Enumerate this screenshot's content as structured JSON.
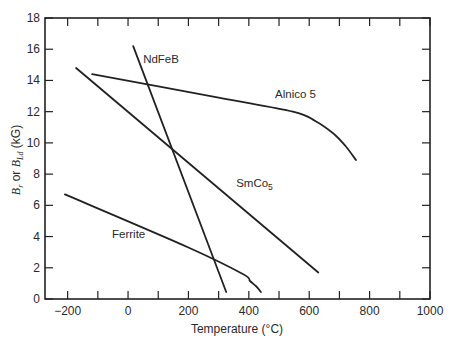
{
  "chart_data": {
    "type": "line",
    "title": "",
    "xlabel": "Temperature (°C)",
    "ylabel": "B_r or B_Ld (kG)",
    "xlim": [
      -275,
      1000
    ],
    "ylim": [
      0,
      18
    ],
    "grid": false,
    "legend": "none (inline curve labels)",
    "x_ticks": [
      -200,
      -100,
      0,
      100,
      200,
      300,
      400,
      500,
      600,
      700,
      800,
      900,
      1000
    ],
    "x_tick_labels": [
      "-200",
      "0",
      "200",
      "400",
      "600",
      "800",
      "1000"
    ],
    "y_ticks": [
      0,
      2,
      4,
      6,
      8,
      10,
      12,
      14,
      16,
      18
    ],
    "y_tick_labels": [
      "0",
      "2",
      "4",
      "6",
      "8",
      "10",
      "12",
      "14",
      "16",
      "18"
    ],
    "series": [
      {
        "name": "NdFeB",
        "x": [
          17,
          325
        ],
        "y": [
          16.2,
          0.45
        ],
        "label_pos": {
          "x": 50,
          "y": 15.1
        }
      },
      {
        "name": "Alnico 5",
        "x": [
          -119,
          300,
          546,
          620,
          680,
          720,
          755
        ],
        "y": [
          14.4,
          12.9,
          12.0,
          11.4,
          10.6,
          9.8,
          8.9
        ],
        "label_pos": {
          "x": 487,
          "y": 12.9
        }
      },
      {
        "name": "SmCo5",
        "x": [
          -172,
          630
        ],
        "y": [
          14.8,
          1.7
        ],
        "label_pos": {
          "x": 358,
          "y": 7.2
        }
      },
      {
        "name": "Ferrite",
        "x": [
          -209,
          200,
          380,
          404,
          425,
          440
        ],
        "y": [
          6.7,
          3.3,
          1.6,
          1.15,
          0.8,
          0.45
        ],
        "label_pos": {
          "x": -53,
          "y": 3.9
        }
      }
    ]
  },
  "labels": {
    "x_axis_title": "Temperature (°C)",
    "y_axis_title_main": "B",
    "y_axis_title_sub1": "r",
    "y_axis_title_or": " or ",
    "y_axis_title_main2": "B",
    "y_axis_title_sub2": "Ld",
    "y_axis_title_unit": " (kG)"
  }
}
